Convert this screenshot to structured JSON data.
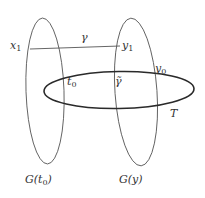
{
  "diagram": {
    "colors": {
      "stroke": "#4a4a4a",
      "thick_stroke": "#2a2a2a",
      "text": "#333333",
      "background": "#ffffff"
    },
    "shapes": {
      "fiber_left": {
        "label": "G(t0)",
        "cx": 45,
        "cy": 91,
        "rx": 19,
        "ry": 73,
        "rotate": -2
      },
      "fiber_right": {
        "label": "G(y)",
        "cx": 136,
        "cy": 92,
        "rx": 21,
        "ry": 74,
        "rotate": -4
      },
      "torus": {
        "label": "T",
        "cx": 119,
        "cy": 90,
        "rx": 75,
        "ry": 19,
        "rotate": -1
      },
      "path_gamma": {
        "label": "γ",
        "x1": 30,
        "y1": 49,
        "x2": 120,
        "y2": 46
      }
    },
    "labels": {
      "x1": {
        "base": "x",
        "sub": "1"
      },
      "gamma": "γ",
      "y1": {
        "base": "y",
        "sub": "1"
      },
      "y0": {
        "base": "y",
        "sub": "0"
      },
      "t0": {
        "base": "t",
        "sub": "0"
      },
      "gamma_tilde": "γ̃",
      "T": "T",
      "G_t0": {
        "base": "G(t",
        "sub": "0",
        "tail": ")"
      },
      "G_y": "G(y)"
    }
  }
}
